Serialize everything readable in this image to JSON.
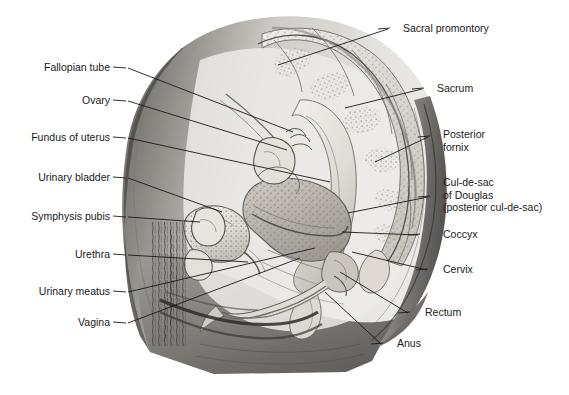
{
  "figure": {
    "type": "anatomical-illustration",
    "background_color": "#ffffff",
    "line_color": "#1a1a1a",
    "palette": {
      "body_light": "#e9e8e4",
      "body_mid": "#b9b6b1",
      "body_dark": "#6e6b68",
      "body_darkest": "#4a4846",
      "organ_fill": "#dedbd5",
      "organ_shade": "#a9a5a0",
      "stipple": "#8d8984"
    }
  },
  "labels_left": [
    {
      "id": "fallopian-tube",
      "text": "Fallopian tube",
      "x": 22,
      "y": 61,
      "w": 88,
      "dash_x": 113,
      "dash_y": 67,
      "line": [
        128,
        68,
        293,
        132
      ]
    },
    {
      "id": "ovary",
      "text": "Ovary",
      "x": 55,
      "y": 94,
      "w": 55,
      "dash_x": 113,
      "dash_y": 100,
      "line": [
        128,
        101,
        287,
        150
      ]
    },
    {
      "id": "fundus-of-uterus",
      "text": "Fundus of uterus",
      "x": 12,
      "y": 131,
      "w": 98,
      "dash_x": 113,
      "dash_y": 137,
      "line": [
        128,
        138,
        330,
        182
      ]
    },
    {
      "id": "urinary-bladder",
      "text": "Urinary bladder",
      "x": 28,
      "y": 171,
      "w": 82,
      "dash_x": 113,
      "dash_y": 177,
      "line": [
        128,
        178,
        222,
        212
      ]
    },
    {
      "id": "symphysis-pubis",
      "text": "Symphysis pubis",
      "x": 22,
      "y": 210,
      "w": 88,
      "dash_x": 113,
      "dash_y": 216,
      "line": [
        128,
        217,
        200,
        222
      ]
    },
    {
      "id": "urethra",
      "text": "Urethra",
      "x": 62,
      "y": 248,
      "w": 48,
      "dash_x": 113,
      "dash_y": 254,
      "line": [
        128,
        255,
        248,
        262
      ]
    },
    {
      "id": "urinary-meatus",
      "text": "Urinary meatus",
      "x": 35,
      "y": 285,
      "w": 75,
      "dash_x": 113,
      "dash_y": 291,
      "line": [
        128,
        292,
        315,
        248
      ]
    },
    {
      "id": "vagina",
      "text": "Vagina",
      "x": 62,
      "y": 316,
      "w": 48,
      "dash_x": 113,
      "dash_y": 322,
      "line": [
        128,
        323,
        300,
        258
      ]
    }
  ],
  "labels_right": [
    {
      "id": "sacral-promontory",
      "text": "Sacral promontory",
      "x": 403,
      "y": 22,
      "dash_x": 390,
      "dash_y": 28,
      "line": [
        388,
        29,
        278,
        65
      ]
    },
    {
      "id": "sacrum",
      "text": "Sacrum",
      "x": 437,
      "y": 82,
      "dash_x": 424,
      "dash_y": 88,
      "line": [
        422,
        89,
        345,
        108
      ]
    },
    {
      "id": "posterior-fornix",
      "text": "Posterior\nfornix",
      "x": 443,
      "y": 128,
      "dash_x": 430,
      "dash_y": 136,
      "line": [
        428,
        137,
        375,
        162
      ]
    },
    {
      "id": "cul-de-sac",
      "text": "Cul-de-sac\nof Douglas\n(posterior cul-de-sac)",
      "x": 443,
      "y": 176,
      "dash_x": 430,
      "dash_y": 196,
      "line": [
        428,
        197,
        348,
        213
      ]
    },
    {
      "id": "coccyx",
      "text": "Coccyx",
      "x": 443,
      "y": 228,
      "dash_x": 420,
      "dash_y": 234,
      "line": [
        418,
        235,
        342,
        232
      ]
    },
    {
      "id": "cervix",
      "text": "Cervix",
      "x": 443,
      "y": 263,
      "dash_x": 428,
      "dash_y": 269,
      "line": [
        427,
        270,
        352,
        252
      ]
    },
    {
      "id": "rectum",
      "text": "Rectum",
      "x": 425,
      "y": 306,
      "dash_x": 410,
      "dash_y": 312,
      "line": [
        408,
        313,
        340,
        272
      ]
    },
    {
      "id": "anus",
      "text": "Anus",
      "x": 397,
      "y": 337,
      "dash_x": 383,
      "dash_y": 343,
      "line": [
        381,
        344,
        325,
        292
      ]
    }
  ]
}
